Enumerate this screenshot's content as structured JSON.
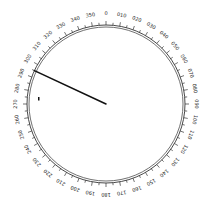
{
  "compass": {
    "center": [
      106,
      104
    ],
    "ring_outer_radius": 79,
    "ring_inner_radius": 77,
    "label_radius": 90,
    "major_tick_step_deg": 10,
    "minor_tick_step_deg": 5,
    "labels": [
      "0",
      "010",
      "020",
      "030",
      "040",
      "050",
      "060",
      "070",
      "080",
      "090",
      "100",
      "110",
      "120",
      "130",
      "140",
      "150",
      "160",
      "170",
      "180",
      "190",
      "200",
      "210",
      "220",
      "230",
      "240",
      "250",
      "260",
      "270",
      "280",
      "290",
      "300",
      "310",
      "320",
      "330",
      "340",
      "350"
    ],
    "needle_bearing_deg": 295,
    "needle_color": "#111111",
    "ring_color": "#333333",
    "marker": {
      "x": 38,
      "y": 97
    }
  }
}
